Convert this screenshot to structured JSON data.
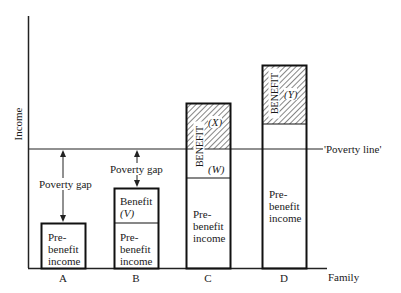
{
  "axes": {
    "y_label": "Income",
    "x_label": "Family",
    "categories": [
      "A",
      "B",
      "C",
      "D"
    ]
  },
  "poverty_line": {
    "label": "'Poverty line'"
  },
  "bars": [
    {
      "family": "A",
      "segments": [
        {
          "type": "pre-benefit",
          "text": [
            "Pre-",
            "benefit",
            "income"
          ]
        }
      ],
      "gap_label": "Poverty gap"
    },
    {
      "family": "B",
      "segments": [
        {
          "type": "pre-benefit",
          "text": [
            "Pre-",
            "benefit",
            "income"
          ]
        },
        {
          "type": "benefit",
          "text": [
            "Benefit",
            "(V)"
          ]
        }
      ],
      "gap_label": "Poverty gap"
    },
    {
      "family": "C",
      "segments": [
        {
          "type": "pre-benefit",
          "text": [
            "Pre-",
            "benefit",
            "income"
          ]
        },
        {
          "type": "benefit-below",
          "label": "(W)"
        },
        {
          "type": "benefit-above",
          "label": "(X)",
          "hatched": true
        }
      ],
      "benefit_vertical": "BENEFIT"
    },
    {
      "family": "D",
      "segments": [
        {
          "type": "pre-benefit",
          "text": [
            "Pre-",
            "benefit",
            "income"
          ]
        },
        {
          "type": "benefit",
          "label": "(Y)",
          "hatched": true
        }
      ],
      "benefit_vertical": "BENEFIT"
    }
  ]
}
